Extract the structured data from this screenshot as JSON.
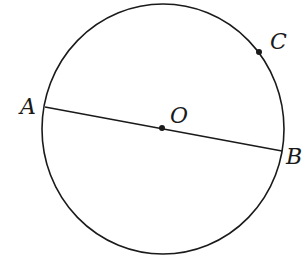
{
  "diagram": {
    "type": "circle-geometry",
    "circle": {
      "center": "O",
      "cx": 162,
      "cy": 129,
      "rx": 121,
      "ry": 125
    },
    "segment": {
      "from": "A",
      "to": "B",
      "passes_through": "O",
      "label": "diameter AB"
    },
    "points": [
      {
        "name": "A",
        "label": "A",
        "x": 45,
        "y": 107,
        "on": "circle"
      },
      {
        "name": "B",
        "label": "B",
        "x": 282,
        "y": 151,
        "on": "circle"
      },
      {
        "name": "O",
        "label": "O",
        "x": 162,
        "y": 128,
        "role": "center"
      },
      {
        "name": "C",
        "label": "C",
        "x": 259,
        "y": 52,
        "on": "circle"
      }
    ],
    "colors": {
      "stroke": "#1a1a1a",
      "background": "#ffffff"
    }
  }
}
